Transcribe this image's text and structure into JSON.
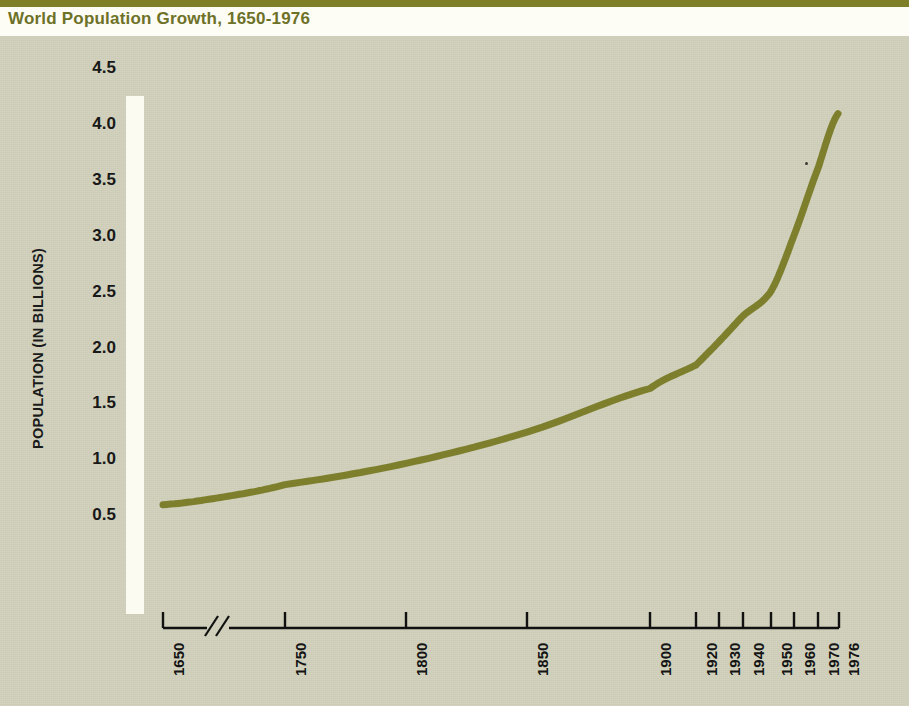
{
  "header": {
    "title": "World Population Growth, 1650-1976",
    "rule_color": "#7e7f27",
    "title_color": "#6e7128"
  },
  "figure": {
    "panel_color": "#ccccb7",
    "curve_color": "#7e7f2d",
    "axis_color": "#000000",
    "axis_break_symbol": "//"
  },
  "chart_data": {
    "type": "line",
    "title": "World Population Growth, 1650-1976",
    "xlabel": "",
    "ylabel": "POPULATION (IN BILLIONS)",
    "grid": false,
    "legend": null,
    "ylim": [
      0,
      4.5
    ],
    "ytick_labels": [
      "4.5",
      "4.0",
      "3.5",
      "3.0",
      "2.5",
      "2.0",
      "1.5",
      "1.0",
      "0.5"
    ],
    "ytick_values": [
      4.5,
      4.0,
      3.5,
      3.0,
      2.5,
      2.0,
      1.5,
      1.0,
      0.5
    ],
    "xtick_labels": [
      "1650",
      "1750",
      "1800",
      "1850",
      "1900",
      "1920",
      "1930",
      "1940",
      "1950",
      "1960",
      "1970",
      "1976"
    ],
    "xtick_values": [
      1650,
      1750,
      1800,
      1850,
      1900,
      1920,
      1930,
      1940,
      1950,
      1960,
      1970,
      1976
    ],
    "x_axis_broken_between": [
      1650,
      1750
    ],
    "series": [
      {
        "name": "World population",
        "x": [
          1650,
          1700,
          1750,
          1800,
          1850,
          1900,
          1920,
          1930,
          1940,
          1950,
          1960,
          1970,
          1976
        ],
        "values": [
          0.61,
          0.68,
          0.79,
          0.98,
          1.26,
          1.65,
          1.86,
          2.07,
          2.3,
          2.52,
          3.02,
          3.62,
          4.11
        ]
      }
    ]
  },
  "axis_pixels": {
    "ytick_y": [
      70,
      126,
      182,
      238,
      294,
      350,
      405,
      461,
      517
    ],
    "xtick_x": [
      163,
      285,
      406,
      527,
      650,
      696,
      719,
      743,
      771,
      794,
      818,
      838
    ],
    "baseline_y": 628,
    "curve_points": "163,505 190,497 220,489 250,482 285,474 320,467 355,460 390,454 425,448 460,441 495,433 527,425 560,415 590,404 620,394 650,385 675,373 696,362 708,354 719,344 731,332 743,319 755,304 766,287 777,266 788,241 798,212 808,182 818,156 828,131 838,113"
  }
}
